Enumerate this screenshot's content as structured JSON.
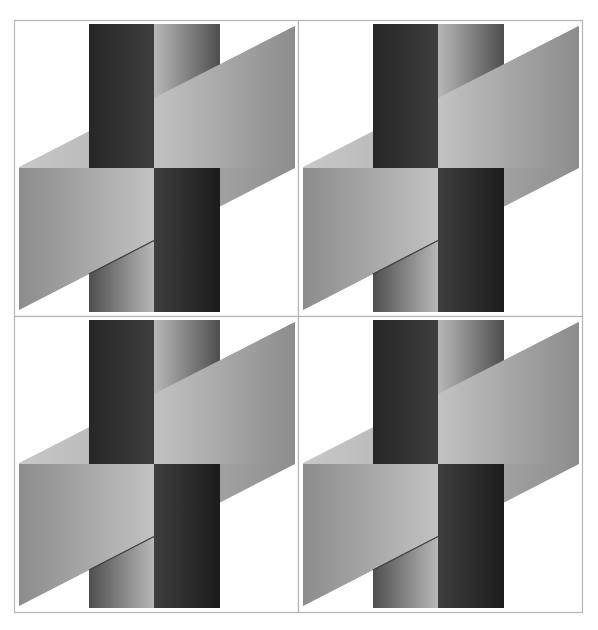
{
  "figure": {
    "grid": {
      "x": 14,
      "y": 20,
      "cols": 2,
      "rows": 2,
      "panel_w": 284,
      "panel_h": 296
    },
    "border_color": "#b4b4b4",
    "panels": [
      {
        "id": "top-left"
      },
      {
        "id": "top-right"
      },
      {
        "id": "bottom-left"
      },
      {
        "id": "bottom-right"
      }
    ],
    "shapes": {
      "band": {
        "points": [
          [
            5,
            147
          ],
          [
            281,
            6
          ],
          [
            281,
            148
          ],
          [
            5,
            290
          ]
        ]
      },
      "upper_right_rect": {
        "x1": 140,
        "x2": 281,
        "y_bottom": 148
      },
      "lower_left_rect": {
        "x1": 5,
        "x2": 140,
        "y_top": 148
      },
      "left_bar": {
        "x": 75,
        "w": 65,
        "y": 4,
        "h": 288
      },
      "right_bar": {
        "x": 140,
        "w": 66,
        "y": 4,
        "h": 288
      },
      "split_y": 148
    },
    "colors": {
      "band_left": "#c8c8c8",
      "band_right": "#8e8e8e",
      "rect_light": "#c2c2c2",
      "rect_mid": "#8c8c8c",
      "bar_dark_a": "#262626",
      "bar_dark_b": "#3e3e3e",
      "bar_grad_light": "#b8b8b8",
      "bar_grad_dark": "#4e4e4e",
      "edge_shadow": "#3a3a3a"
    }
  }
}
